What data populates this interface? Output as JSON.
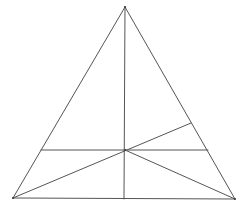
{
  "diagram": {
    "type": "geometric-figure",
    "stroke_color": "#555555",
    "background_color": "#ffffff",
    "vertices": {
      "apex": [
        125,
        7
      ],
      "bottom_left": [
        13,
        198
      ],
      "bottom_right": [
        235,
        199
      ],
      "center": [
        125,
        150
      ]
    },
    "segments": [
      {
        "name": "triangle-left-side",
        "from": [
          125,
          7
        ],
        "to": [
          13,
          198
        ]
      },
      {
        "name": "triangle-right-side",
        "from": [
          125,
          7
        ],
        "to": [
          235,
          199
        ]
      },
      {
        "name": "triangle-base",
        "from": [
          13,
          198
        ],
        "to": [
          235,
          199
        ]
      },
      {
        "name": "vertical-median",
        "from": [
          125,
          7
        ],
        "to": [
          124,
          199
        ]
      },
      {
        "name": "horizontal-line",
        "from": [
          41,
          150
        ],
        "to": [
          208,
          150
        ]
      },
      {
        "name": "diagonal-bottom-left-to-right-side",
        "from": [
          13,
          198
        ],
        "to": [
          191,
          123
        ]
      },
      {
        "name": "diagonal-center-to-bottom-right",
        "from": [
          125,
          150
        ],
        "to": [
          235,
          199
        ]
      }
    ]
  }
}
